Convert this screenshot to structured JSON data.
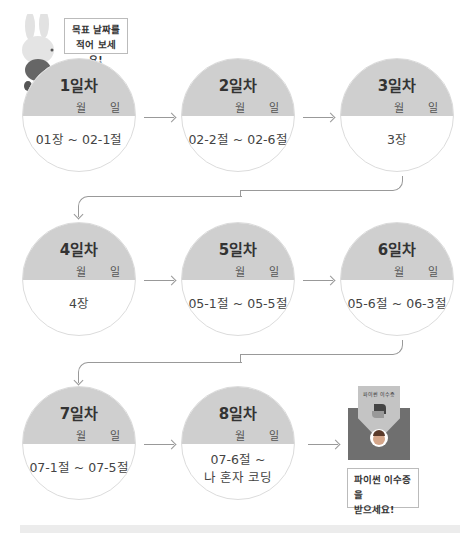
{
  "speech_top": {
    "line1": "목표 날짜를",
    "line2": "적어 보세요!"
  },
  "speech_bottom": {
    "line1": "파이썬 이수증을",
    "line2": "받으세요!"
  },
  "certificate": {
    "title": "파이썬 이수증"
  },
  "days": [
    {
      "day": "1일차",
      "month_label": "월",
      "date_label": "일",
      "range": "01장 ~ 02-1절"
    },
    {
      "day": "2일차",
      "month_label": "월",
      "date_label": "일",
      "range": "02-2절 ~ 02-6절"
    },
    {
      "day": "3일차",
      "month_label": "월",
      "date_label": "일",
      "range": "3장"
    },
    {
      "day": "4일차",
      "month_label": "월",
      "date_label": "일",
      "range": "4장"
    },
    {
      "day": "5일차",
      "month_label": "월",
      "date_label": "일",
      "range": "05-1절 ~ 05-5절"
    },
    {
      "day": "6일차",
      "month_label": "월",
      "date_label": "일",
      "range": "05-6절 ~ 06-3절"
    },
    {
      "day": "7일차",
      "month_label": "월",
      "date_label": "일",
      "range": "07-1절 ~ 07-5절"
    },
    {
      "day": "8일차",
      "month_label": "월",
      "date_label": "일",
      "range_line1": "07-6절 ~",
      "range_line2": "나 혼자 코딩"
    }
  ],
  "colors": {
    "circle_top": "#cfcfcf",
    "line": "#999999",
    "envelope": "#6f6f6f"
  }
}
